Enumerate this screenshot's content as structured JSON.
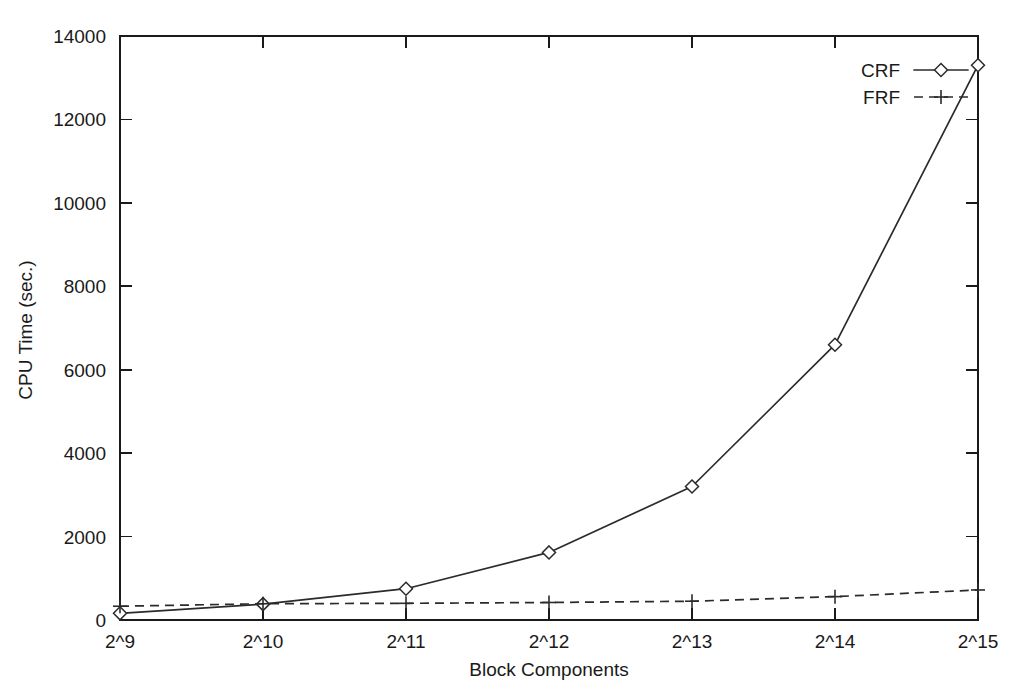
{
  "chart_data": {
    "type": "line",
    "title": "",
    "xlabel": "Block Components",
    "ylabel": "CPU Time (sec.)",
    "x": [
      "2^9",
      "2^10",
      "2^11",
      "2^12",
      "2^13",
      "2^14",
      "2^15"
    ],
    "categories": [
      "2^9",
      "2^10",
      "2^11",
      "2^12",
      "2^13",
      "2^14",
      "2^15"
    ],
    "xtick_labels": [
      "2^9",
      "2^10",
      "2^11",
      "2^12",
      "2^13",
      "2^14",
      "2^15"
    ],
    "ytick_labels": [
      "0",
      "2000",
      "4000",
      "6000",
      "8000",
      "10000",
      "12000",
      "14000"
    ],
    "ytick_values": [
      0,
      2000,
      4000,
      6000,
      8000,
      10000,
      12000,
      14000
    ],
    "ylim": [
      0,
      14000
    ],
    "grid": false,
    "legend_position": "top-right-inside",
    "frame": "box",
    "series": [
      {
        "name": "CRF",
        "values": [
          160,
          380,
          750,
          1620,
          3200,
          6600,
          13300
        ],
        "linestyle": "solid",
        "marker": "diamond",
        "color": "#2b2b2b"
      },
      {
        "name": "FRF",
        "values": [
          330,
          390,
          400,
          420,
          450,
          560,
          720
        ],
        "linestyle": "dashed",
        "marker": "plus",
        "color": "#2b2b2b"
      }
    ]
  },
  "legend": {
    "entries": [
      {
        "label": "CRF"
      },
      {
        "label": "FRF"
      }
    ]
  },
  "colors": {
    "background": "#ffffff",
    "axis": "#1a1a1a",
    "ink": "#2b2b2b"
  }
}
